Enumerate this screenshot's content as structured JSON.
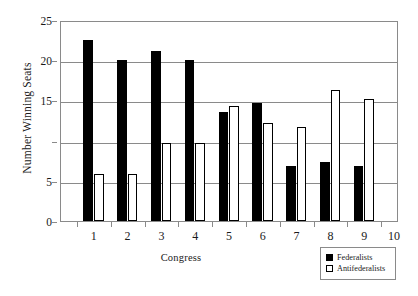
{
  "chart_data": {
    "type": "bar",
    "title": "",
    "xlabel": "Congress",
    "ylabel": "Number Winning Seats",
    "categories": [
      "1",
      "2",
      "3",
      "4",
      "5",
      "6",
      "7",
      "8",
      "9"
    ],
    "series": [
      {
        "name": "Federalists",
        "values": [
          22.5,
          20.0,
          21.2,
          20.0,
          13.5,
          14.7,
          6.9,
          7.3,
          6.9
        ]
      },
      {
        "name": "Antifederalists",
        "values": [
          5.8,
          5.8,
          9.7,
          9.7,
          14.3,
          12.2,
          11.7,
          16.3,
          15.2
        ]
      }
    ],
    "ylim": [
      0,
      25
    ],
    "yticks": [
      0,
      5,
      10,
      15,
      20,
      25
    ],
    "ytick_labels": [
      "0",
      "5",
      "",
      "15",
      "20",
      "25"
    ],
    "xlim": [
      0,
      10
    ],
    "xticks": [
      1,
      2,
      3,
      4,
      5,
      6,
      7,
      8,
      9,
      10
    ],
    "xtick_labels": [
      "1",
      "2",
      "3",
      "4",
      "5",
      "6",
      "7",
      "8",
      "9",
      "10"
    ],
    "grid": "horizontal",
    "legend_position": "bottom-right",
    "colors": {
      "federalists": "#000000",
      "antifederalists": "#ffffff",
      "bar_outline": "#000000",
      "axis": "#8a8a8a",
      "background": "#ffffff",
      "text": "#1a1a1a"
    }
  },
  "legend": {
    "items": [
      {
        "label": "Federalists",
        "swatch": "filled-black-square"
      },
      {
        "label": "Antifederalists",
        "swatch": "open-white-square"
      }
    ]
  }
}
